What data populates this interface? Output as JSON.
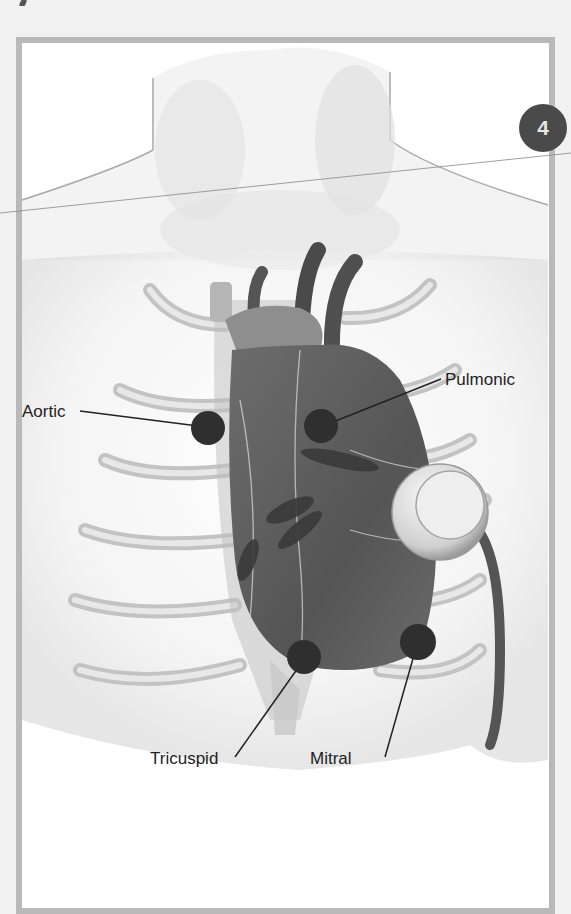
{
  "figure": {
    "badge_number": "4",
    "badge_color": "#4a4a4a",
    "marker_color": "#2f2f2f",
    "frame_color": "#b9b9b9",
    "labels": {
      "aortic": "Aortic",
      "pulmonic": "Pulmonic",
      "tricuspid": "Tricuspid",
      "mitral": "Mitral"
    }
  }
}
